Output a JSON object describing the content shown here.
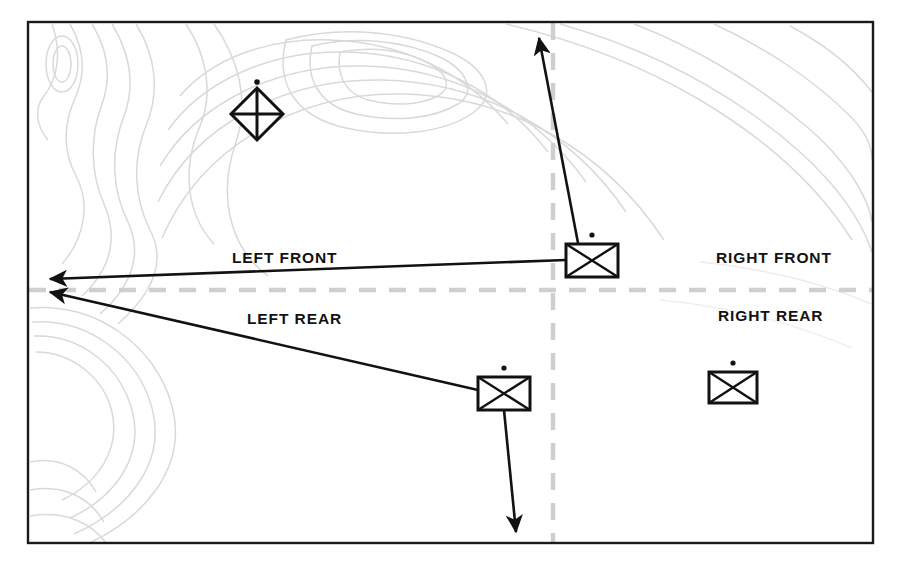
{
  "diagram": {
    "frame": {
      "stroke": "#1a1a1a",
      "x": 28,
      "y": 22,
      "width": 845,
      "height": 521
    },
    "colors": {
      "ink": "#121212",
      "contour": "#d8d8d8",
      "boundary_dash": "#cfcfcf",
      "background": "#ffffff"
    },
    "sector_labels": [
      {
        "name": "left-front",
        "text": "LEFT FRONT",
        "x": 232,
        "y": 249
      },
      {
        "name": "right-front",
        "text": "RIGHT FRONT",
        "x": 716,
        "y": 249
      },
      {
        "name": "left-rear",
        "text": "LEFT REAR",
        "x": 247,
        "y": 310
      },
      {
        "name": "right-rear",
        "text": "RIGHT REAR",
        "x": 718,
        "y": 307
      }
    ],
    "boundaries": [
      {
        "name": "horizontal-sector-boundary",
        "orientation": "horizontal",
        "x1": 29,
        "y1": 290,
        "x2": 872,
        "y2": 290,
        "style": "dashed",
        "color": "#cfcfcf",
        "width": 4
      },
      {
        "name": "vertical-sector-boundary",
        "orientation": "vertical",
        "x1": 553,
        "y1": 23,
        "x2": 553,
        "y2": 542,
        "style": "dashed",
        "color": "#cfcfcf",
        "width": 4
      }
    ],
    "units": [
      {
        "name": "infantry-unit-front",
        "symbol": "infantry-rectangle-x",
        "echelon_dot": true,
        "x": 566,
        "y": 244,
        "width": 52,
        "height": 33
      },
      {
        "name": "infantry-unit-rear",
        "symbol": "infantry-rectangle-x",
        "echelon_dot": true,
        "x": 478,
        "y": 377,
        "width": 52,
        "height": 33
      },
      {
        "name": "infantry-unit-right-rear",
        "symbol": "infantry-rectangle-x",
        "echelon_dot": true,
        "x": 709,
        "y": 372,
        "width": 48,
        "height": 31
      }
    ],
    "hq_symbol": {
      "name": "headquarters-diamond",
      "symbol": "four-quadrant-diamond",
      "echelon_dot": true,
      "cx": 257,
      "cy": 114,
      "radius": 26
    },
    "arrows": [
      {
        "name": "arrow-left-front",
        "x1": 566,
        "y1": 260,
        "x2": 48,
        "y2": 279
      },
      {
        "name": "arrow-left-rear",
        "x1": 478,
        "y1": 390,
        "x2": 48,
        "y2": 291
      },
      {
        "name": "arrow-up-front",
        "x1": 578,
        "y1": 243,
        "x2": 539,
        "y2": 34
      },
      {
        "name": "arrow-down-rear",
        "x1": 504,
        "y1": 410,
        "x2": 517,
        "y2": 536
      }
    ],
    "contours": {
      "name": "topographic-contour-lines",
      "color": "#d8d8d8",
      "description": "light gray terrain contour lines"
    }
  }
}
